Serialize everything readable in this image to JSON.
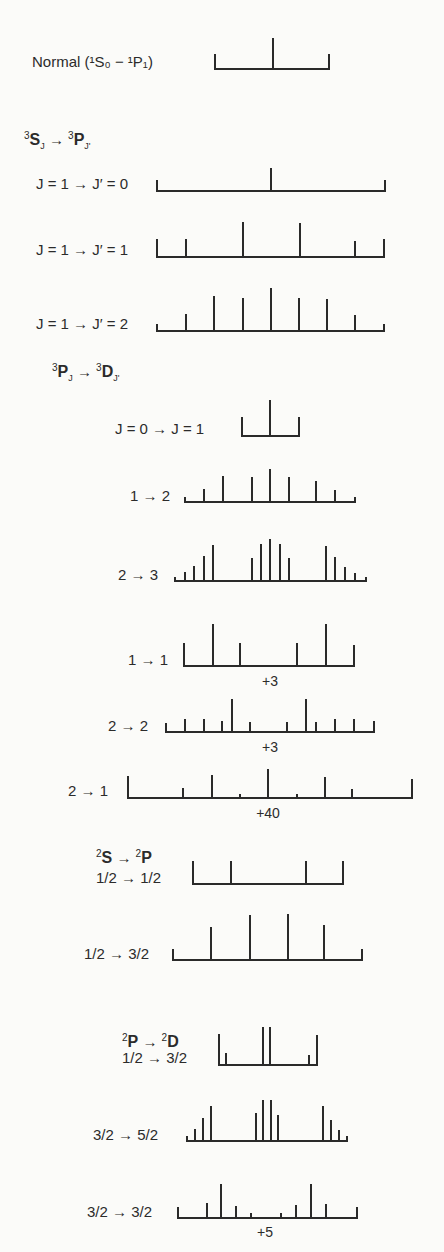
{
  "stroke_color": "#2a2a2a",
  "background": "#fbfbf9",
  "headers": [
    {
      "id": "triplet-s-p",
      "prefix_sup": "3",
      "term_a": "S",
      "sub_a": "J",
      "arrow": "→",
      "sup_b": "3",
      "term_b": "P",
      "sub_b": "J'",
      "x": 24,
      "y": 128
    },
    {
      "id": "triplet-p-d",
      "prefix_sup": "3",
      "term_a": "P",
      "sub_a": "J",
      "arrow": "→",
      "sup_b": "3",
      "term_b": "D",
      "sub_b": "J'",
      "x": 52,
      "y": 360
    },
    {
      "id": "doublet-s-p",
      "prefix_sup": "2",
      "term_a": "S",
      "sub_a": "",
      "arrow": "→",
      "sup_b": "2",
      "term_b": "P",
      "sub_b": "",
      "x": 96,
      "y": 846
    },
    {
      "id": "doublet-p-d",
      "prefix_sup": "2",
      "term_a": "P",
      "sub_a": "",
      "arrow": "→",
      "sup_b": "2",
      "term_b": "D",
      "sub_b": "",
      "x": 122,
      "y": 1030
    }
  ],
  "patterns": [
    {
      "name": "normal",
      "label": "Normal (¹S₀ − ¹P₁)",
      "label_x": 32,
      "label_y": 54,
      "baseline": 69,
      "x0": 215,
      "x1": 329,
      "end_left_top": 55,
      "end_right_top": 55,
      "lines": [
        [
          273,
          39
        ]
      ],
      "note": ""
    },
    {
      "name": "s-p-1-0",
      "label": "J = 1 → J′ = 0",
      "label_x": 36,
      "label_y": 176,
      "baseline": 191,
      "x0": 157,
      "x1": 385,
      "end_left_top": 181,
      "end_right_top": 181,
      "lines": [
        [
          271,
          169
        ]
      ],
      "note": ""
    },
    {
      "name": "s-p-1-1",
      "label": "J = 1 → J′ = 1",
      "label_x": 36,
      "label_y": 242,
      "baseline": 257,
      "x0": 157,
      "x1": 384,
      "end_left_top": 240,
      "end_right_top": 240,
      "lines": [
        [
          186,
          240
        ],
        [
          243,
          223
        ],
        [
          300,
          224
        ],
        [
          355,
          242
        ]
      ],
      "note": ""
    },
    {
      "name": "s-p-1-2",
      "label": "J = 1 → J′ = 2",
      "label_x": 36,
      "label_y": 316,
      "baseline": 331,
      "x0": 157,
      "x1": 384,
      "end_left_top": 325,
      "end_right_top": 325,
      "lines": [
        [
          186,
          315
        ],
        [
          214,
          297
        ],
        [
          243,
          299
        ],
        [
          271,
          289
        ],
        [
          299,
          299
        ],
        [
          327,
          300
        ],
        [
          355,
          316
        ]
      ],
      "note": ""
    },
    {
      "name": "p-d-0-1",
      "label": "J = 0 → J = 1",
      "label_x": 115,
      "label_y": 421,
      "baseline": 436,
      "x0": 242,
      "x1": 299,
      "end_left_top": 418,
      "end_right_top": 418,
      "lines": [
        [
          270,
          401
        ]
      ],
      "note": ""
    },
    {
      "name": "p-d-1-2",
      "label": "1 → 2",
      "label_x": 130,
      "label_y": 488,
      "baseline": 502,
      "x0": 185,
      "x1": 355,
      "end_left_top": 498,
      "end_right_top": 498,
      "lines": [
        [
          204,
          490
        ],
        [
          223,
          477
        ],
        [
          252,
          478
        ],
        [
          270,
          470
        ],
        [
          289,
          478
        ],
        [
          316,
          482
        ],
        [
          335,
          491
        ]
      ],
      "note": ""
    },
    {
      "name": "p-d-2-3",
      "label": "2 → 3",
      "label_x": 118,
      "label_y": 567,
      "baseline": 581,
      "x0": 175,
      "x1": 366,
      "end_left_top": 578,
      "end_right_top": 578,
      "lines": [
        [
          185,
          573
        ],
        [
          194,
          567
        ],
        [
          204,
          557
        ],
        [
          213,
          546
        ],
        [
          252,
          559
        ],
        [
          261,
          545
        ],
        [
          270,
          540
        ],
        [
          280,
          545
        ],
        [
          289,
          559
        ],
        [
          326,
          547
        ],
        [
          335,
          558
        ],
        [
          345,
          568
        ],
        [
          355,
          574
        ]
      ],
      "note": ""
    },
    {
      "name": "p-d-1-1",
      "label": "1 → 1",
      "label_x": 128,
      "label_y": 652,
      "baseline": 666,
      "x0": 184,
      "x1": 354,
      "end_left_top": 644,
      "end_right_top": 646,
      "lines": [
        [
          213,
          625
        ],
        [
          240,
          644
        ],
        [
          297,
          644
        ],
        [
          326,
          625
        ]
      ],
      "note": "+3",
      "note_x": 270,
      "note_y": 674
    },
    {
      "name": "p-d-2-2",
      "label": "2 → 2",
      "label_x": 108,
      "label_y": 718,
      "baseline": 732,
      "x0": 166,
      "x1": 374,
      "end_left_top": 724,
      "end_right_top": 722,
      "lines": [
        [
          185,
          720
        ],
        [
          204,
          720
        ],
        [
          222,
          722
        ],
        [
          232,
          700
        ],
        [
          250,
          723
        ],
        [
          287,
          723
        ],
        [
          306,
          700
        ],
        [
          316,
          723
        ],
        [
          335,
          720
        ],
        [
          354,
          720
        ]
      ],
      "note": "+3",
      "note_x": 270,
      "note_y": 740
    },
    {
      "name": "p-d-2-1",
      "label": "2 → 1",
      "label_x": 68,
      "label_y": 783,
      "baseline": 798,
      "x0": 128,
      "x1": 412,
      "end_left_top": 777,
      "end_right_top": 780,
      "lines": [
        [
          183,
          789
        ],
        [
          212,
          776
        ],
        [
          240,
          795
        ],
        [
          268,
          770
        ],
        [
          297,
          795
        ],
        [
          325,
          778
        ],
        [
          352,
          790
        ]
      ],
      "note": "+40",
      "note_x": 268,
      "note_y": 806
    },
    {
      "name": "s-p-half-half",
      "label": "1/2 → 1/2",
      "label_x": 96,
      "label_y": 870,
      "baseline": 884,
      "x0": 193,
      "x1": 343,
      "end_left_top": 862,
      "end_right_top": 862,
      "lines": [
        [
          231,
          862
        ],
        [
          306,
          862
        ]
      ],
      "note": ""
    },
    {
      "name": "s-p-half-threehalf",
      "label": "1/2 → 3/2",
      "label_x": 84,
      "label_y": 946,
      "baseline": 960,
      "x0": 173,
      "x1": 362,
      "end_left_top": 950,
      "end_right_top": 950,
      "lines": [
        [
          211,
          928
        ],
        [
          250,
          916
        ],
        [
          288,
          915
        ],
        [
          324,
          926
        ]
      ],
      "note": ""
    },
    {
      "name": "p-d-half-threehalf",
      "label": "1/2 → 3/2",
      "label_x": 122,
      "label_y": 1050,
      "baseline": 1065,
      "x0": 219,
      "x1": 317,
      "end_left_top": 1035,
      "end_right_top": 1036,
      "lines": [
        [
          226,
          1054
        ],
        [
          263,
          1028
        ],
        [
          270,
          1028
        ],
        [
          309,
          1056
        ]
      ],
      "note": ""
    },
    {
      "name": "p-d-threehalf-fivehalf",
      "label": "3/2 → 5/2",
      "label_x": 93,
      "label_y": 1127,
      "baseline": 1141,
      "x0": 187,
      "x1": 347,
      "end_left_top": 1137,
      "end_right_top": 1137,
      "lines": [
        [
          195,
          1130
        ],
        [
          203,
          1119
        ],
        [
          211,
          1107
        ],
        [
          256,
          1114
        ],
        [
          263,
          1101
        ],
        [
          271,
          1101
        ],
        [
          278,
          1116
        ],
        [
          323,
          1107
        ],
        [
          331,
          1121
        ],
        [
          339,
          1131
        ]
      ],
      "note": ""
    },
    {
      "name": "p-d-threehalf-threehalf",
      "label": "3/2 → 3/2",
      "label_x": 87,
      "label_y": 1204,
      "baseline": 1218,
      "x0": 178,
      "x1": 357,
      "end_left_top": 1208,
      "end_right_top": 1208,
      "lines": [
        [
          207,
          1204
        ],
        [
          221,
          1185
        ],
        [
          236,
          1207
        ],
        [
          251,
          1214
        ],
        [
          281,
          1214
        ],
        [
          296,
          1206
        ],
        [
          311,
          1185
        ],
        [
          326,
          1205
        ]
      ],
      "note": "+5",
      "note_x": 265,
      "note_y": 1225
    }
  ]
}
